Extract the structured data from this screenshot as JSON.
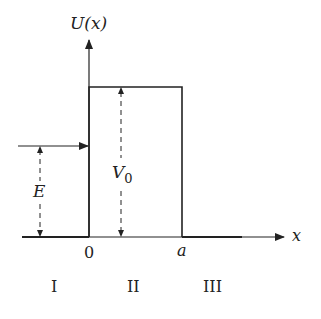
{
  "diagram": {
    "y_axis_label": "U(x)",
    "x_axis_label": "x",
    "energy_label": "E",
    "barrier_label": "V",
    "barrier_subscript": "0",
    "origin_label": "0",
    "width_label": "a",
    "regions": [
      "I",
      "II",
      "III"
    ],
    "line_color": "#222222"
  }
}
